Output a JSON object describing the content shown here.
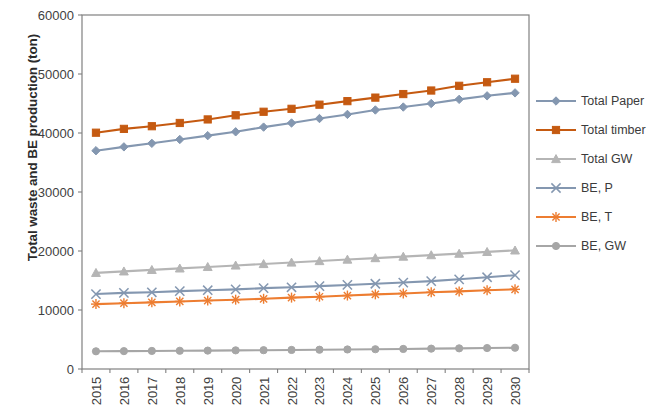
{
  "chart_data": {
    "type": "line",
    "title": "",
    "xlabel": "",
    "ylabel": "Total waste and BE production (ton)",
    "ylim": [
      0,
      60000
    ],
    "ytick_labels": [
      "0",
      "10000",
      "20000",
      "30000",
      "40000",
      "50000",
      "60000"
    ],
    "ytick_values": [
      0,
      10000,
      20000,
      30000,
      40000,
      50000,
      60000
    ],
    "grid": false,
    "legend_position": "right",
    "categories": [
      "2015",
      "2016",
      "2017",
      "2018",
      "2019",
      "2020",
      "2021",
      "2022",
      "2023",
      "2024",
      "2025",
      "2026",
      "2027",
      "2028",
      "2029",
      "2030"
    ],
    "series": [
      {
        "name": "Total Paper",
        "color": "#8497b0",
        "marker": "diamond",
        "values": [
          37000,
          37650,
          38250,
          38900,
          39550,
          40200,
          41000,
          41700,
          42450,
          43150,
          43900,
          44400,
          45000,
          45700,
          46300,
          46800
        ]
      },
      {
        "name": "Total timber",
        "color": "#c55a11",
        "marker": "square",
        "values": [
          40050,
          40700,
          41150,
          41700,
          42300,
          43000,
          43600,
          44100,
          44800,
          45400,
          46000,
          46600,
          47200,
          48000,
          48600,
          49200
        ]
      },
      {
        "name": "Total GW",
        "color": "#b5b5b5",
        "marker": "triangle",
        "values": [
          16300,
          16550,
          16800,
          17050,
          17300,
          17550,
          17800,
          18050,
          18300,
          18550,
          18800,
          19050,
          19300,
          19550,
          19850,
          20100
        ]
      },
      {
        "name": "BE, P",
        "color": "#8497b0",
        "marker": "cross",
        "values": [
          12700,
          12900,
          13000,
          13200,
          13350,
          13500,
          13700,
          13850,
          14050,
          14250,
          14450,
          14650,
          14900,
          15200,
          15550,
          15900
        ]
      },
      {
        "name": "BE, T",
        "color": "#ed7d31",
        "marker": "star",
        "values": [
          11000,
          11150,
          11300,
          11450,
          11600,
          11750,
          11900,
          12100,
          12250,
          12450,
          12650,
          12800,
          13000,
          13150,
          13350,
          13500
        ]
      },
      {
        "name": "BE, GW",
        "color": "#a6a6a6",
        "marker": "circle",
        "values": [
          3000,
          3030,
          3060,
          3090,
          3120,
          3160,
          3190,
          3230,
          3270,
          3310,
          3350,
          3400,
          3450,
          3500,
          3550,
          3600
        ]
      }
    ]
  },
  "legend": {
    "items": [
      {
        "label": "Total Paper"
      },
      {
        "label": "Total timber"
      },
      {
        "label": "Total GW"
      },
      {
        "label": "BE, P"
      },
      {
        "label": "BE, T"
      },
      {
        "label": "BE, GW"
      }
    ]
  },
  "axis": {
    "y_title": "Total waste and BE production (ton)"
  }
}
